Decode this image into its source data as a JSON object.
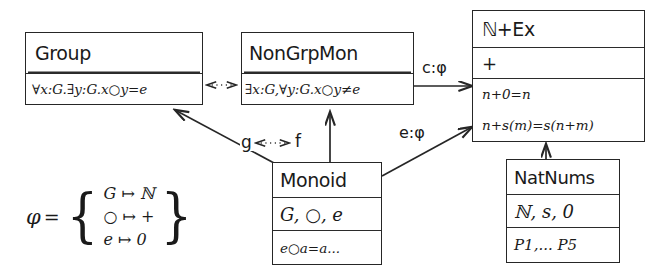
{
  "diagram": {
    "nodes": {
      "group": {
        "name": "Group",
        "axiom": "∀x:G.∃y:G.x○y=e"
      },
      "nongrpmon": {
        "name": "NonGrpMon",
        "axiom": "∃x:G,∀y:G.x○y≠e"
      },
      "nex": {
        "name": "ℕ+Ex",
        "signature": "+",
        "axiom1": "n+0=n",
        "axiom2": "n+s(m)=s(n+m)"
      },
      "monoid": {
        "name": "Monoid",
        "signature": "G, ○, e",
        "axiom": "e○a=a..."
      },
      "natnums": {
        "name": "NatNums",
        "signature": "ℕ, s, 0",
        "axiom": "P1,... P5"
      }
    },
    "edges": {
      "c_phi": "c:φ",
      "e_phi": "e:φ",
      "g": "g",
      "f": "f"
    },
    "phi_def": {
      "symbol": "φ",
      "equals": "=",
      "open_brace": "{",
      "close_brace": "}",
      "mappings": [
        "G ↦ ℕ",
        "○ ↦ +",
        "e ↦ 0"
      ]
    }
  }
}
